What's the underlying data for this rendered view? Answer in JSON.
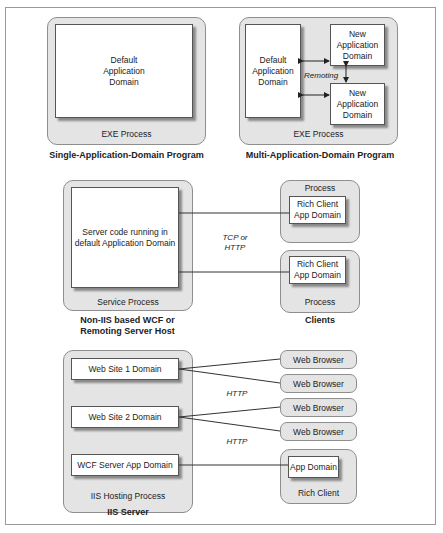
{
  "panel1": {
    "domain": "Default\nApplication\nDomain",
    "process": "EXE Process",
    "caption": "Single-Application-Domain Program"
  },
  "panel2": {
    "default_domain": "Default\nApplication\nDomain",
    "new_domains": [
      "New\nApplication\nDomain",
      "New\nApplication\nDomain"
    ],
    "remoting_label": "Remoting",
    "process": "EXE Process",
    "caption": "Multi-Application-Domain Program"
  },
  "panel3": {
    "server_domain": "Server code running in\ndefault Application Domain",
    "server_process": "Service Process",
    "server_caption": "Non-IIS based WCF or\nRemoting Server Host",
    "protocol": "TCP or\nHTTP",
    "clients": [
      {
        "process": "Process",
        "domain": "Rich Client\nApp Domain"
      },
      {
        "process": "Process",
        "domain": "Rich Client\nApp Domain"
      }
    ],
    "clients_caption": "Clients"
  },
  "panel4": {
    "domains": [
      "Web Site 1 Domain",
      "Web Site 2 Domain",
      "WCF Server App Domain"
    ],
    "process": "IIS Hosting Process",
    "caption": "IIS Server",
    "protocols": [
      "HTTP",
      "HTTP"
    ],
    "browsers": [
      "Web Browser",
      "Web Browser",
      "Web Browser",
      "Web Browser"
    ],
    "rich_client": {
      "domain": "App Domain",
      "process": "Rich Client"
    }
  }
}
